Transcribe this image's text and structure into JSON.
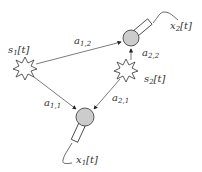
{
  "diagram": {
    "sources": [
      {
        "id": "s1",
        "label": "s",
        "sub": "1",
        "arg": "[t]",
        "x": 25,
        "y": 68
      },
      {
        "id": "s2",
        "label": "s",
        "sub": "2",
        "arg": "[t]",
        "x": 126,
        "y": 70
      }
    ],
    "microphones": [
      {
        "id": "x1",
        "label": "x",
        "sub": "1",
        "arg": "[t]",
        "x": 85,
        "y": 117
      },
      {
        "id": "x2",
        "label": "x",
        "sub": "2",
        "arg": "[t]",
        "x": 131,
        "y": 38
      }
    ],
    "edges": [
      {
        "from": "s1",
        "to": "x2",
        "label": "a",
        "sub": "1,2"
      },
      {
        "from": "s2",
        "to": "x2",
        "label": "a",
        "sub": "2,2"
      },
      {
        "from": "s1",
        "to": "x1",
        "label": "a",
        "sub": "1,1"
      },
      {
        "from": "s2",
        "to": "x1",
        "label": "a",
        "sub": "2,1"
      }
    ],
    "colors": {
      "mic_fill": "#cccccc",
      "stroke": "#333333",
      "background": "#ffffff"
    }
  }
}
